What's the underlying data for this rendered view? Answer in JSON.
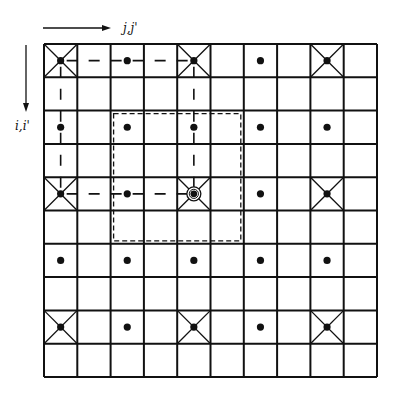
{
  "diagram": {
    "type": "grid-lattice",
    "grid": {
      "rows": 10,
      "cols": 10,
      "origin_x": 44,
      "origin_y": 44,
      "cell_size": 33.3,
      "line_color": "#111111",
      "line_width": 2
    },
    "axes": {
      "horizontal": {
        "label": "j,j'",
        "direction": "right"
      },
      "vertical": {
        "label": "i,i'",
        "direction": "down"
      }
    },
    "crossed_cells": [
      {
        "row": 0,
        "col": 0
      },
      {
        "row": 0,
        "col": 4
      },
      {
        "row": 0,
        "col": 8
      },
      {
        "row": 4,
        "col": 0
      },
      {
        "row": 4,
        "col": 4
      },
      {
        "row": 4,
        "col": 8
      },
      {
        "row": 8,
        "col": 0
      },
      {
        "row": 8,
        "col": 4
      },
      {
        "row": 8,
        "col": 8
      }
    ],
    "dots": [
      {
        "row": 0,
        "col": 0
      },
      {
        "row": 0,
        "col": 2
      },
      {
        "row": 0,
        "col": 4
      },
      {
        "row": 0,
        "col": 6
      },
      {
        "row": 0,
        "col": 8
      },
      {
        "row": 2,
        "col": 0
      },
      {
        "row": 2,
        "col": 2
      },
      {
        "row": 2,
        "col": 4
      },
      {
        "row": 2,
        "col": 6
      },
      {
        "row": 2,
        "col": 8
      },
      {
        "row": 4,
        "col": 0
      },
      {
        "row": 4,
        "col": 2
      },
      {
        "row": 4,
        "col": 4
      },
      {
        "row": 4,
        "col": 6
      },
      {
        "row": 4,
        "col": 8
      },
      {
        "row": 6,
        "col": 0
      },
      {
        "row": 6,
        "col": 2
      },
      {
        "row": 6,
        "col": 4
      },
      {
        "row": 6,
        "col": 6
      },
      {
        "row": 6,
        "col": 8
      },
      {
        "row": 8,
        "col": 0
      },
      {
        "row": 8,
        "col": 2
      },
      {
        "row": 8,
        "col": 4
      },
      {
        "row": 8,
        "col": 6
      },
      {
        "row": 8,
        "col": 8
      }
    ],
    "circled_point": {
      "row": 4,
      "col": 4
    },
    "dashed_path": [
      {
        "from": {
          "row": 0,
          "col": 0
        },
        "to": {
          "row": 0,
          "col": 4
        }
      },
      {
        "from": {
          "row": 0,
          "col": 0
        },
        "to": {
          "row": 4,
          "col": 0
        }
      },
      {
        "from": {
          "row": 4,
          "col": 0
        },
        "to": {
          "row": 4,
          "col": 4
        }
      },
      {
        "from": {
          "row": 0,
          "col": 4
        },
        "to": {
          "row": 4,
          "col": 4
        }
      }
    ],
    "dashed_box": {
      "row_start": 2,
      "col_start": 2,
      "row_end": 5,
      "col_end": 5,
      "inset": 3
    }
  }
}
